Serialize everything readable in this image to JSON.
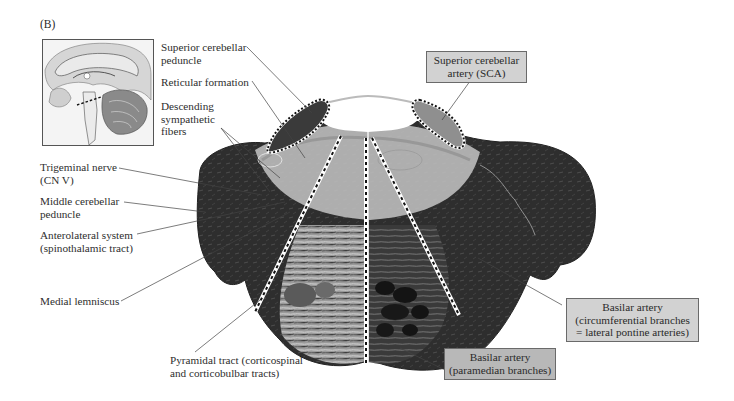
{
  "figure": {
    "panel_label": "(B)",
    "inset": {
      "description": "Midsagittal brain view with dashed line marking the level of the pontine section"
    },
    "left_labels": [
      {
        "id": "superior-cerebellar-peduncle",
        "text": "Superior cerebellar\npeduncle"
      },
      {
        "id": "reticular-formation",
        "text": "Reticular formation"
      },
      {
        "id": "descending-sympathetic-fibers",
        "text": "Descending\nsympathetic\nfibers"
      },
      {
        "id": "trigeminal-nerve",
        "text": "Trigeminal nerve\n(CN V)"
      },
      {
        "id": "middle-cerebellar-peduncle",
        "text": "Middle cerebellar\npeduncle"
      },
      {
        "id": "anterolateral-system",
        "text": "Anterolateral system\n(spinothalamic tract)"
      },
      {
        "id": "medial-lemniscus",
        "text": "Medial lemniscus"
      },
      {
        "id": "pyramidal-tract",
        "text": "Pyramidal tract (corticospinal\nand corticobulbar tracts)"
      }
    ],
    "artery_boxes": [
      {
        "id": "sca",
        "text": "Superior cerebellar\nartery (SCA)"
      },
      {
        "id": "basilar-circumferential",
        "text": "Basilar artery\n(circumferential branches\n= lateral pontine arteries)"
      },
      {
        "id": "basilar-paramedian",
        "text": "Basilar artery\n(paramedian branches)"
      }
    ],
    "colors": {
      "tissue_dark": "#2b2b2b",
      "tissue_mid": "#6e6e6e",
      "tissue_light": "#c9c9c9",
      "sca_region": "#8f8f8f",
      "box_fill": "#d2d2d2",
      "box_fill_dark": "#b8b8b8",
      "leader_line": "#444444"
    }
  }
}
